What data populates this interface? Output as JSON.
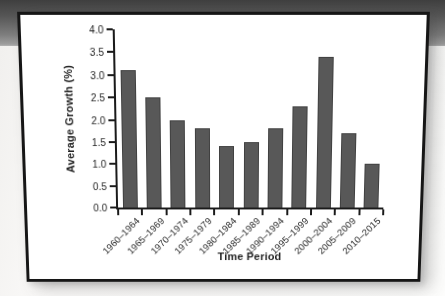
{
  "page": {
    "background_color": "#fbfaf9",
    "banner_color_top": "#3f3f3f",
    "banner_color_bottom": "#9d9d9d",
    "card_background": "#ffffff",
    "card_border_color": "#161616"
  },
  "chart_data": {
    "type": "bar",
    "title": "",
    "categories": [
      "1960–1964",
      "1965–1969",
      "1970–1974",
      "1975–1979",
      "1980–1984",
      "1985–1989",
      "1990–1994",
      "1995–1999",
      "2000–2004",
      "2005–2009",
      "2010–2015"
    ],
    "values": [
      3.1,
      2.5,
      2.0,
      1.8,
      1.4,
      1.5,
      1.8,
      2.3,
      3.4,
      1.7,
      1.0
    ],
    "xlabel": "Time Period",
    "ylabel": "Average Growth (%)",
    "ylim": [
      0,
      4.0
    ],
    "ytick_step": 0.5,
    "yticks": [
      "0.0",
      "0.5",
      "1.0",
      "1.5",
      "2.0",
      "2.5",
      "3.0",
      "3.5",
      "4.0"
    ],
    "bar_color": "#585858",
    "axis_color": "#1a1a1a",
    "grid": false,
    "legend": "none"
  }
}
